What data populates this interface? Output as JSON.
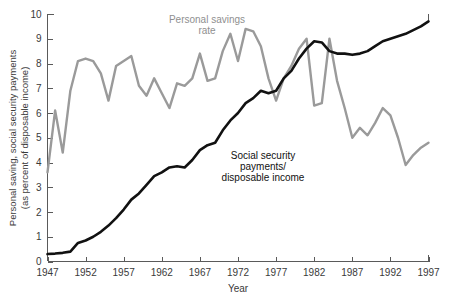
{
  "chart_data": {
    "type": "line",
    "title": "",
    "xlabel": "Year",
    "ylabel": "Personal saving, social security payments (as percent of disposable income)",
    "ylabel_line1": "Personal saving, social security payments",
    "ylabel_line2": "(as percent of disposable income)",
    "xlim": [
      1947,
      1997
    ],
    "ylim": [
      0,
      10
    ],
    "ytick_labels": [
      "0",
      "1",
      "2",
      "3",
      "4",
      "5",
      "6",
      "7",
      "8",
      "9",
      "10"
    ],
    "yticks": [
      0,
      1,
      2,
      3,
      4,
      5,
      6,
      7,
      8,
      9,
      10
    ],
    "xtick_labels": [
      "1947",
      "1952",
      "1957",
      "1962",
      "1967",
      "1972",
      "1977",
      "1982",
      "1987",
      "1992",
      "1997"
    ],
    "xticks": [
      1947,
      1952,
      1957,
      1962,
      1967,
      1972,
      1977,
      1982,
      1987,
      1992,
      1997
    ],
    "grid": false,
    "legend_position": "inline-annotations",
    "annotations": [
      {
        "name": "personal-savings-rate-label",
        "text_line1": "Personal savings",
        "text_line2": "rate",
        "color": "#8f8f8f",
        "x": 1964.0,
        "y": 9.65
      },
      {
        "name": "social-security-payments-label",
        "text_line1": "Social security",
        "text_line2": "payments/",
        "text_line3": "disposable income",
        "color": "#111111",
        "x": 1978.0,
        "y": 4.5
      }
    ],
    "x": [
      1947,
      1948,
      1949,
      1950,
      1951,
      1952,
      1953,
      1954,
      1955,
      1956,
      1957,
      1958,
      1959,
      1960,
      1961,
      1962,
      1963,
      1964,
      1965,
      1966,
      1967,
      1968,
      1969,
      1970,
      1971,
      1972,
      1973,
      1974,
      1975,
      1976,
      1977,
      1978,
      1979,
      1980,
      1981,
      1982,
      1983,
      1984,
      1985,
      1986,
      1987,
      1988,
      1989,
      1990,
      1991,
      1992,
      1993,
      1994,
      1995,
      1996,
      1997
    ],
    "series": [
      {
        "name": "Personal savings rate",
        "color": "#9a9a9a",
        "linewidth": 2.4,
        "values": [
          3.6,
          6.1,
          4.4,
          6.9,
          8.1,
          8.2,
          8.1,
          7.6,
          6.5,
          7.9,
          8.1,
          8.3,
          7.1,
          6.7,
          7.4,
          6.8,
          6.2,
          7.2,
          7.1,
          7.4,
          8.4,
          7.3,
          7.4,
          8.5,
          9.2,
          8.1,
          9.4,
          9.3,
          8.7,
          7.4,
          6.5,
          7.4,
          7.9,
          8.6,
          9.0,
          6.3,
          6.4,
          9.0,
          7.3,
          6.2,
          5.0,
          5.4,
          5.1,
          5.6,
          6.2,
          5.9,
          5.0,
          3.9,
          4.3,
          4.6,
          4.8
        ]
      },
      {
        "name": "Social security payments/disposable income",
        "color": "#111111",
        "linewidth": 2.6,
        "values": [
          0.3,
          0.32,
          0.35,
          0.4,
          0.75,
          0.85,
          1.0,
          1.2,
          1.45,
          1.75,
          2.1,
          2.5,
          2.75,
          3.1,
          3.45,
          3.6,
          3.8,
          3.85,
          3.8,
          4.1,
          4.5,
          4.7,
          4.8,
          5.3,
          5.7,
          6.0,
          6.4,
          6.6,
          6.9,
          6.8,
          6.9,
          7.4,
          7.7,
          8.2,
          8.6,
          8.9,
          8.85,
          8.5,
          8.4,
          8.4,
          8.35,
          8.4,
          8.5,
          8.7,
          8.9,
          9.0,
          9.1,
          9.2,
          9.35,
          9.5,
          9.7
        ]
      }
    ]
  }
}
